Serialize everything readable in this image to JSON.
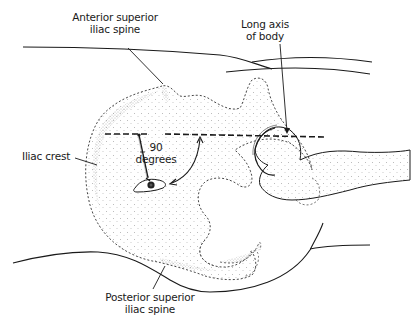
{
  "figure": {
    "labels": {
      "asis_line1": "Anterior superior",
      "asis_line2": "iliac spine",
      "axis_line1": "Long axis",
      "axis_line2": "of body",
      "iliac_crest": "Iliac crest",
      "angle_line1": "90",
      "angle_line2": "degrees",
      "psis_line1": "Posterior superior",
      "psis_line2": "iliac spine"
    },
    "colors": {
      "ink": "#1a1a1a",
      "stipple": "#6a6a6a",
      "background": "#ffffff"
    }
  }
}
